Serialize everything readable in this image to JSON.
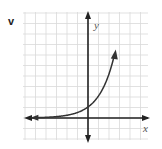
{
  "problem_label": "v",
  "chart_data": {
    "type": "line",
    "title": "",
    "xlabel": "x",
    "ylabel": "y",
    "grid": true,
    "xlim": [
      -6,
      5
    ],
    "ylim": [
      -3,
      9
    ],
    "series": [
      {
        "name": "y = 2^x",
        "x": [
          -5,
          -4,
          -3,
          -2,
          -1,
          0,
          1,
          2,
          3
        ],
        "y": [
          0.03,
          0.06,
          0.13,
          0.25,
          0.5,
          1,
          2,
          4,
          8
        ]
      }
    ]
  },
  "colors": {
    "grid": "#d9d9d9",
    "axis": "#222222",
    "curve": "#333333"
  }
}
